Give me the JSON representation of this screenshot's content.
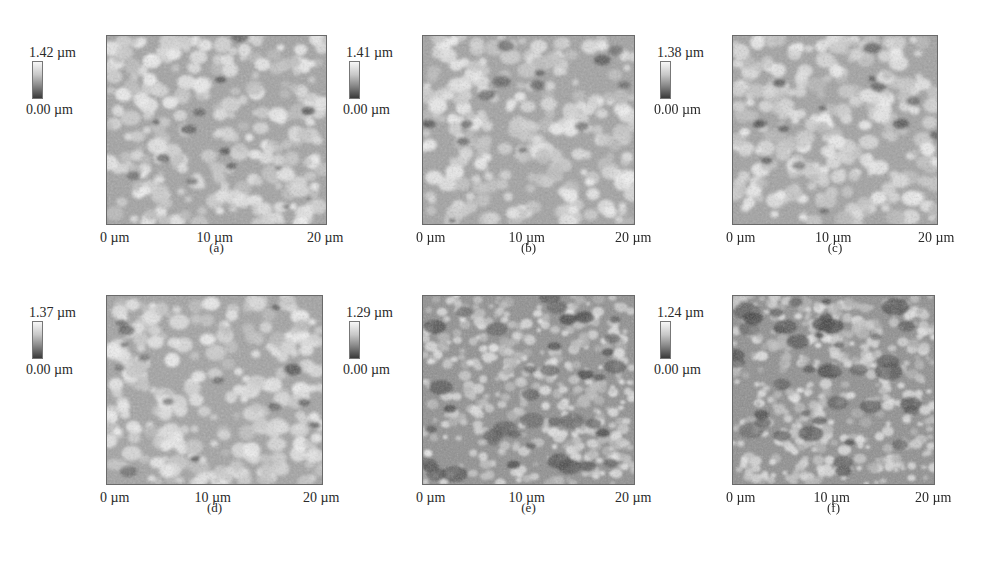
{
  "figure": {
    "panels": [
      {
        "id": "a",
        "caption": "(a)",
        "colorbar_max": "1.42 µm",
        "colorbar_min": "0.00 µm",
        "x_ticks": [
          "0 µm",
          "10 µm",
          "20 µm"
        ],
        "y_ticks": [
          "20 µm",
          "10 µm",
          "0 µm"
        ],
        "tone": "coarse"
      },
      {
        "id": "b",
        "caption": "(b)",
        "colorbar_max": "1.41 µm",
        "colorbar_min": "0.00 µm",
        "x_ticks": [
          "0 µm",
          "10 µm",
          "20 µm"
        ],
        "y_ticks": [
          "20 µm",
          "10 µm",
          "0 µm"
        ],
        "tone": "coarse"
      },
      {
        "id": "c",
        "caption": "(c)",
        "colorbar_max": "1.38 µm",
        "colorbar_min": "0.00 µm",
        "x_ticks": [
          "0 µm",
          "10 µm",
          "20 µm"
        ],
        "y_ticks": [
          "20 µm",
          "10 µm",
          "0 µm"
        ],
        "tone": "coarse"
      },
      {
        "id": "d",
        "caption": "(d)",
        "colorbar_max": "1.37 µm",
        "colorbar_min": "0.00 µm",
        "x_ticks": [
          "0 µm",
          "10 µm",
          "20 µm"
        ],
        "y_ticks": [
          "20 µm",
          "10 µm",
          "0 µm"
        ],
        "tone": "coarse"
      },
      {
        "id": "e",
        "caption": "(e)",
        "colorbar_max": "1.29 µm",
        "colorbar_min": "0.00 µm",
        "x_ticks": [
          "0 µm",
          "10 µm",
          "20 µm"
        ],
        "y_ticks": [
          "20 µm",
          "10 µm",
          "0 µm"
        ],
        "tone": "fine"
      },
      {
        "id": "f",
        "caption": "(f)",
        "colorbar_max": "1.24 µm",
        "colorbar_min": "0.00 µm",
        "x_ticks": [
          "0 µm",
          "10 µm",
          "20 µm"
        ],
        "y_ticks": [
          "20 µm",
          "10 µm",
          "0 µm"
        ],
        "tone": "fine"
      }
    ]
  },
  "chart_data": [
    {
      "type": "heatmap",
      "title": "(a)",
      "xlabel": "",
      "ylabel": "",
      "x_range": [
        0,
        20
      ],
      "y_range": [
        0,
        20
      ],
      "units": "µm",
      "x_tick_labels": [
        "0 µm",
        "10 µm",
        "20 µm"
      ],
      "y_tick_labels": [
        "0 µm",
        "10 µm",
        "20 µm"
      ],
      "colorbar": {
        "min": 0.0,
        "max": 1.42,
        "unit": "µm",
        "colormap": "grayscale"
      }
    },
    {
      "type": "heatmap",
      "title": "(b)",
      "xlabel": "",
      "ylabel": "",
      "x_range": [
        0,
        20
      ],
      "y_range": [
        0,
        20
      ],
      "units": "µm",
      "x_tick_labels": [
        "0 µm",
        "10 µm",
        "20 µm"
      ],
      "y_tick_labels": [
        "0 µm",
        "10 µm",
        "20 µm"
      ],
      "colorbar": {
        "min": 0.0,
        "max": 1.41,
        "unit": "µm",
        "colormap": "grayscale"
      }
    },
    {
      "type": "heatmap",
      "title": "(c)",
      "xlabel": "",
      "ylabel": "",
      "x_range": [
        0,
        20
      ],
      "y_range": [
        0,
        20
      ],
      "units": "µm",
      "x_tick_labels": [
        "0 µm",
        "10 µm",
        "20 µm"
      ],
      "y_tick_labels": [
        "0 µm",
        "10 µm",
        "20 µm"
      ],
      "colorbar": {
        "min": 0.0,
        "max": 1.38,
        "unit": "µm",
        "colormap": "grayscale"
      }
    },
    {
      "type": "heatmap",
      "title": "(d)",
      "xlabel": "",
      "ylabel": "",
      "x_range": [
        0,
        20
      ],
      "y_range": [
        0,
        20
      ],
      "units": "µm",
      "x_tick_labels": [
        "0 µm",
        "10 µm",
        "20 µm"
      ],
      "y_tick_labels": [
        "0 µm",
        "10 µm",
        "20 µm"
      ],
      "colorbar": {
        "min": 0.0,
        "max": 1.37,
        "unit": "µm",
        "colormap": "grayscale"
      }
    },
    {
      "type": "heatmap",
      "title": "(e)",
      "xlabel": "",
      "ylabel": "",
      "x_range": [
        0,
        20
      ],
      "y_range": [
        0,
        20
      ],
      "units": "µm",
      "x_tick_labels": [
        "0 µm",
        "10 µm",
        "20 µm"
      ],
      "y_tick_labels": [
        "0 µm",
        "10 µm",
        "20 µm"
      ],
      "colorbar": {
        "min": 0.0,
        "max": 1.29,
        "unit": "µm",
        "colormap": "grayscale"
      }
    },
    {
      "type": "heatmap",
      "title": "(f)",
      "xlabel": "",
      "ylabel": "",
      "x_range": [
        0,
        20
      ],
      "y_range": [
        0,
        20
      ],
      "units": "µm",
      "x_tick_labels": [
        "0 µm",
        "10 µm",
        "20 µm"
      ],
      "y_tick_labels": [
        "0 µm",
        "10 µm",
        "20 µm"
      ],
      "colorbar": {
        "min": 0.0,
        "max": 1.24,
        "unit": "µm",
        "colormap": "grayscale"
      }
    }
  ]
}
